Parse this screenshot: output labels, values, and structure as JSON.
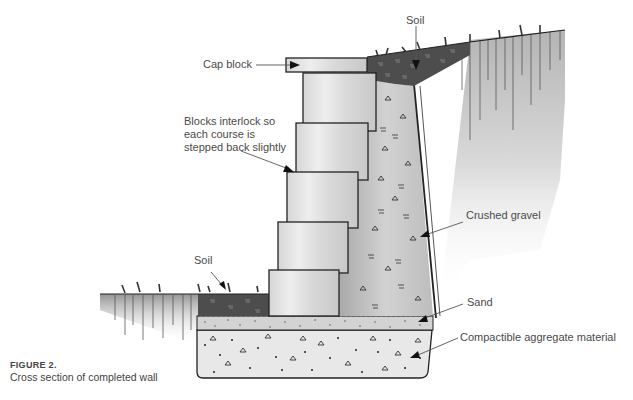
{
  "figure": {
    "number": "FIGURE 2.",
    "caption": "Cross section of completed wall"
  },
  "labels": {
    "cap_block": "Cap block",
    "soil_top": "Soil",
    "blocks_interlock": "Blocks interlock so each course is stepped back slightly",
    "crushed_gravel": "Crushed gravel",
    "soil_bottom": "Soil",
    "sand": "Sand",
    "compactible_aggregate": "Compactible aggregate material"
  },
  "components": [
    {
      "name": "cap-block",
      "label": "Cap block"
    },
    {
      "name": "wall-block",
      "count": 5
    },
    {
      "name": "crushed-gravel-backfill",
      "label": "Crushed gravel"
    },
    {
      "name": "sand-layer",
      "label": "Sand"
    },
    {
      "name": "aggregate-base",
      "label": "Compactible aggregate material"
    },
    {
      "name": "soil-upper",
      "label": "Soil"
    },
    {
      "name": "soil-lower",
      "label": "Soil"
    }
  ],
  "colors": {
    "text": "#4a4a4a",
    "outline": "#222222",
    "block_fill": "#e4e4e4",
    "soil_fill": "#555555",
    "gravel_fill": "#c9c9c9",
    "sand_fill": "#d2d2d2",
    "aggregate_fill": "#e6e6e6"
  }
}
